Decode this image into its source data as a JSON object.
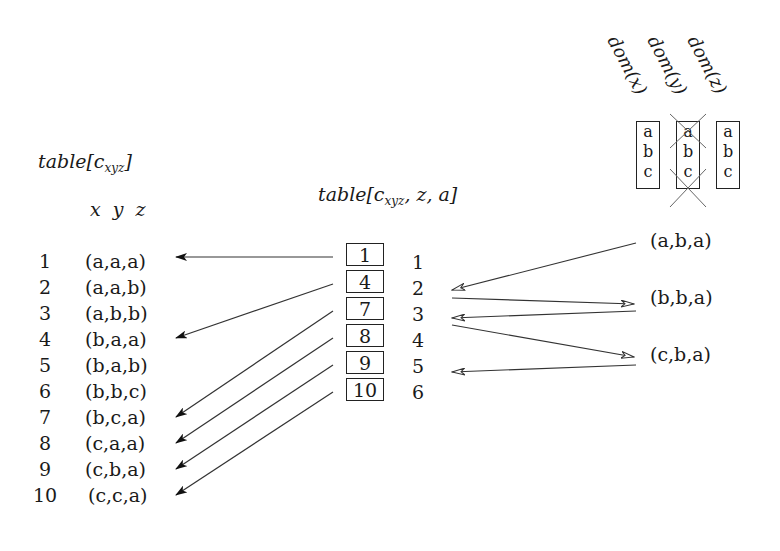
{
  "left_table": {
    "title_main": "table[c",
    "title_sub": "xyz",
    "title_close": "]",
    "columns_label": "x y z",
    "rows": [
      {
        "index": "1",
        "tuple": "(a,a,a)"
      },
      {
        "index": "2",
        "tuple": "(a,a,b)"
      },
      {
        "index": "3",
        "tuple": "(a,b,b)"
      },
      {
        "index": "4",
        "tuple": "(b,a,a)"
      },
      {
        "index": "5",
        "tuple": "(b,a,b)"
      },
      {
        "index": "6",
        "tuple": "(b,b,c)"
      },
      {
        "index": "7",
        "tuple": "(b,c,a)"
      },
      {
        "index": "8",
        "tuple": "(c,a,a)"
      },
      {
        "index": "9",
        "tuple": "(c,b,a)"
      },
      {
        "index": "10",
        "tuple": "(c,c,a)"
      }
    ]
  },
  "middle_table": {
    "title_main": "table[c",
    "title_sub": "xyz",
    "title_close": ", z, a]",
    "cells": [
      "1",
      "4",
      "7",
      "8",
      "9",
      "10"
    ],
    "row_numbers": [
      "1",
      "2",
      "3",
      "4",
      "5",
      "6"
    ]
  },
  "domains": [
    {
      "label": "dom(x)",
      "values": [
        "a",
        "b",
        "c"
      ],
      "crossed": false
    },
    {
      "label": "dom(y)",
      "values": [
        "a",
        "b",
        "c"
      ],
      "crossed": true
    },
    {
      "label": "dom(z)",
      "values": [
        "a",
        "b",
        "c"
      ],
      "crossed": false
    }
  ],
  "query_tuples": [
    "(a,b,a)",
    "(b,b,a)",
    "(c,b,a)"
  ],
  "colors": {
    "ink": "#1a1a1a",
    "line": "#333333",
    "cross": "#555555"
  }
}
